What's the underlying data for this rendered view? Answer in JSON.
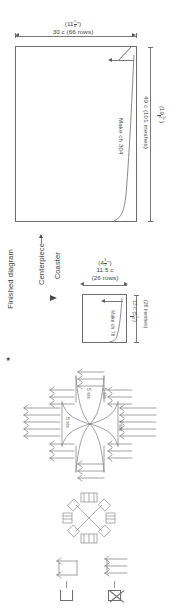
{
  "document": {
    "kind": "filet-crochet-pattern-diagram",
    "note_label": "Finished diagram",
    "note_marker": "★"
  },
  "centerpiece": {
    "label": "Centerpiece",
    "width_imperial": {
      "whole": "11",
      "num": "7",
      "den": "8",
      "unit": "\""
    },
    "width_metric": "30 c (66 rows)",
    "height_imperial": {
      "whole": "19",
      "num": "1",
      "den": "4",
      "unit": "\""
    },
    "height_metric": "49 c (101 meshes)",
    "foundation": "Make ch 304"
  },
  "coaster": {
    "label": "Coaster",
    "width_imperial": {
      "whole": "4",
      "num": "1",
      "den": "2",
      "unit": "\""
    },
    "width_metric_line1": "11.5 c",
    "width_metric_line2": "(26 rows)",
    "height_imperial": {
      "whole": "5",
      "num": "1",
      "den": "8",
      "unit": "\""
    },
    "height_metric_prefix": "13 c",
    "height_metric": "(26 meshes)",
    "foundation": "Make ch 79"
  },
  "stitch_chart": {
    "labels": [
      {
        "id": "left",
        "text": "5 sts"
      },
      {
        "id": "upper-left",
        "text": "5 sts"
      },
      {
        "id": "upper-right",
        "text": "5 sts"
      },
      {
        "id": "right",
        "text": "7 sts"
      }
    ]
  },
  "legend": {
    "items": [
      {
        "id": "open-mesh",
        "symbol": "open-square"
      },
      {
        "id": "closed-mesh",
        "symbol": "crossed-square"
      }
    ]
  }
}
